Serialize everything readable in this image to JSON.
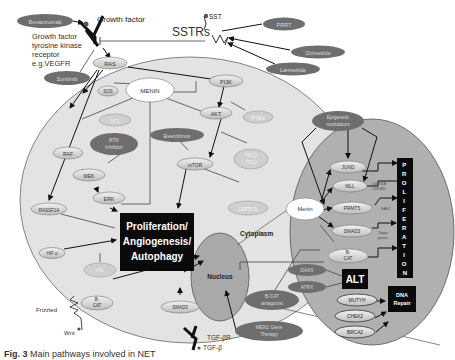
{
  "labels": {
    "growth_factor": "Growth factor",
    "gf_receptor_1": "Growth factor",
    "gf_receptor_2": "tyrosine kinase",
    "gf_receptor_3": "receptor",
    "gf_receptor_4": "e.g.VEGFR",
    "sst": "SST",
    "sstrs": "SSTRs",
    "cytoplasm": "Cytoplasm",
    "nucleus": "Nucleus",
    "frizzled": "Frizzled",
    "wnt": "Wnt",
    "tgfbr": "TGF-βR",
    "tgfb": "TGF-β",
    "target_genes_1": "Target",
    "target_genes_2": "genes",
    "cdkn1b": "CDKN1B",
    "cdkn2c": "CDKN2C",
    "gas1": "GAS1"
  },
  "drugs": {
    "bevacizumab": "Bevacizumab",
    "sunitinib": "Sunitinib",
    "prrt": "PRRT",
    "octreotide": "Octreotide",
    "lanreotide": "Lanreotide",
    "everolimus": "Everolimus",
    "rtk_inhibitor_1": "RTK",
    "rtk_inhibitor_2": "Inhibitor",
    "epigenetic_1": "Epigenetic",
    "epigenetic_2": "modulators",
    "bcat_antagonist_1": "B-CAT",
    "bcat_antagonist_2": "antagonist",
    "men1_therapy_1": "MEN1 Gene",
    "men1_therapy_2": "Therapy"
  },
  "cytoplasm_nodes": {
    "ras": "RAS",
    "sos": "SOS",
    "menin": "MENIN",
    "pi3k": "PI3K",
    "akt": "AKT",
    "pten": "PTEN",
    "nf1": "NF1",
    "raf": "RAF",
    "mek": "MEK",
    "erk": "ERK",
    "mtor": "mTOR",
    "tsc": "TSC1/",
    "tsc2": "TSC2",
    "ddit4": "DEPDC5",
    "rassf1a": "RASSF1A",
    "hif": "HIF α",
    "vhl": "VHL",
    "bcat_1": "B-",
    "bcat_2": "CAT",
    "smad3": "SMAD3"
  },
  "outcome": {
    "line1": "Proliferation/",
    "line2": "Angiogenesis/",
    "line3": "Autophagy"
  },
  "nucleus_nodes": {
    "menin": "Menin",
    "jund": "JUND",
    "mll": "MLL",
    "prmt5": "PRMT5",
    "smad3": "SMAD3",
    "bcat_1": "B-",
    "bcat_2": "CAT",
    "daxx": "DAXX",
    "atrx": "ATRX",
    "mutyh": "MUTYH",
    "chek2": "CHEK2",
    "brca2": "BRCA2"
  },
  "boxes": {
    "proliferation_vertical": [
      "P",
      "R",
      "O",
      "L",
      "I",
      "F",
      "E",
      "R",
      "A",
      "T",
      "I",
      "O",
      "N"
    ],
    "alt": "ALT",
    "dna_repair_1": "DNA",
    "dna_repair_2": "Repair"
  },
  "caption": {
    "fig": "Fig. 3",
    "text": "  Main pathways involved in NET"
  },
  "colors": {
    "cell_fill": "#e3e3e3",
    "nucleus_fill": "#a9a9a9",
    "drug_fill": "#6e6e6e",
    "node_fill": "#cfcfcf",
    "black_box": "#0a0a0a"
  }
}
